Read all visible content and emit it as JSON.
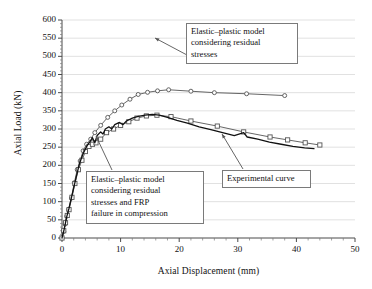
{
  "chart_data": {
    "type": "line",
    "title": "",
    "xlabel": "Axial Displacement (mm)",
    "ylabel": "Axial Load (kN)",
    "xlim": [
      0,
      50
    ],
    "ylim": [
      0,
      600
    ],
    "xticks": [
      0,
      10,
      20,
      30,
      40,
      50
    ],
    "yticks": [
      0,
      50,
      100,
      150,
      200,
      250,
      300,
      350,
      400,
      450,
      500,
      550,
      600
    ],
    "xminor_step": 2,
    "yminor_step": 10,
    "grid": "horizontal-major",
    "legend": "none",
    "series": [
      {
        "name": "Elastic-plastic model considering residual stresses",
        "marker": "circle",
        "color": "#555555",
        "points": [
          [
            0.0,
            0
          ],
          [
            0.3,
            18
          ],
          [
            0.5,
            38
          ],
          [
            0.8,
            60
          ],
          [
            1.1,
            78
          ],
          [
            1.6,
            110
          ],
          [
            2.1,
            152
          ],
          [
            2.6,
            188
          ],
          [
            3.1,
            212
          ],
          [
            3.6,
            240
          ],
          [
            4.2,
            258
          ],
          [
            4.9,
            272
          ],
          [
            5.6,
            290
          ],
          [
            6.6,
            310
          ],
          [
            7.8,
            332
          ],
          [
            9.0,
            350
          ],
          [
            10.2,
            366
          ],
          [
            11.6,
            382
          ],
          [
            13.0,
            395
          ],
          [
            14.6,
            401
          ],
          [
            16.3,
            405
          ],
          [
            18.2,
            408
          ],
          [
            22.0,
            404
          ],
          [
            26.0,
            400
          ],
          [
            31.5,
            397
          ],
          [
            38.0,
            392
          ]
        ]
      },
      {
        "name": "Elastic-plastic model considering residual stresses and FRP failure in compression",
        "marker": "square",
        "color": "#555555",
        "points": [
          [
            0.0,
            0
          ],
          [
            0.3,
            20
          ],
          [
            0.6,
            42
          ],
          [
            0.9,
            62
          ],
          [
            1.2,
            78
          ],
          [
            1.7,
            112
          ],
          [
            2.2,
            150
          ],
          [
            2.8,
            188
          ],
          [
            3.4,
            214
          ],
          [
            4.0,
            238
          ],
          [
            4.6,
            252
          ],
          [
            5.2,
            258
          ],
          [
            5.8,
            262
          ],
          [
            6.6,
            272
          ],
          [
            7.6,
            290
          ],
          [
            8.8,
            300
          ],
          [
            10.0,
            310
          ],
          [
            11.4,
            320
          ],
          [
            12.8,
            330
          ],
          [
            14.4,
            336
          ],
          [
            16.2,
            338
          ],
          [
            18.6,
            334
          ],
          [
            22.0,
            322
          ],
          [
            26.5,
            308
          ],
          [
            31.0,
            292
          ],
          [
            35.5,
            278
          ],
          [
            38.5,
            270
          ],
          [
            41.5,
            262
          ],
          [
            44.0,
            256
          ]
        ]
      },
      {
        "name": "Experimental curve",
        "marker": "none",
        "color": "#111111",
        "points": [
          [
            0.0,
            0
          ],
          [
            0.4,
            26
          ],
          [
            0.8,
            58
          ],
          [
            1.2,
            82
          ],
          [
            1.8,
            124
          ],
          [
            2.4,
            166
          ],
          [
            3.0,
            206
          ],
          [
            3.6,
            232
          ],
          [
            4.2,
            252
          ],
          [
            4.8,
            266
          ],
          [
            5.2,
            276
          ],
          [
            5.6,
            262
          ],
          [
            6.0,
            282
          ],
          [
            6.6,
            292
          ],
          [
            7.0,
            286
          ],
          [
            7.4,
            300
          ],
          [
            8.0,
            306
          ],
          [
            8.5,
            300
          ],
          [
            9.0,
            312
          ],
          [
            9.8,
            318
          ],
          [
            10.4,
            312
          ],
          [
            11.0,
            322
          ],
          [
            12.0,
            330
          ],
          [
            13.0,
            335
          ],
          [
            14.2,
            338
          ],
          [
            15.4,
            340
          ],
          [
            16.6,
            338
          ],
          [
            18.0,
            332
          ],
          [
            19.6,
            324
          ],
          [
            21.4,
            316
          ],
          [
            23.4,
            306
          ],
          [
            25.4,
            298
          ],
          [
            27.4,
            290
          ],
          [
            29.4,
            282
          ],
          [
            31.0,
            290
          ],
          [
            31.6,
            278
          ],
          [
            33.4,
            272
          ],
          [
            35.4,
            264
          ],
          [
            37.4,
            258
          ],
          [
            39.4,
            252
          ],
          [
            41.4,
            248
          ],
          [
            43.0,
            246
          ]
        ]
      }
    ],
    "annotations": [
      {
        "id": "callout-upper",
        "lines": [
          "Elastic–plastic model",
          "considering residual",
          "stresses"
        ],
        "leader_from": [
          187,
          55
        ],
        "leader_to": [
          155,
          38
        ]
      },
      {
        "id": "callout-lower",
        "lines": [
          "Elastic–plastic model",
          "considering residual",
          "stresses and FRP",
          "failure in compression"
        ],
        "leader_from": [
          112,
          170
        ],
        "leader_to": [
          96,
          136
        ]
      },
      {
        "id": "callout-exp",
        "lines": [
          "Experimental curve"
        ],
        "leader_from": [
          243,
          169
        ],
        "leader_to": [
          222,
          134
        ]
      }
    ]
  }
}
